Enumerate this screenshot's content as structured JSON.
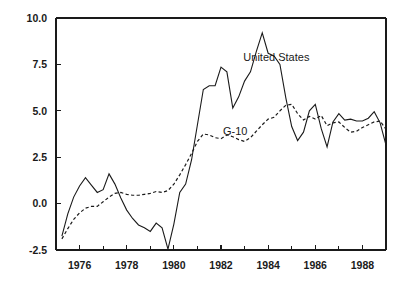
{
  "chart_data": {
    "type": "line",
    "title": "",
    "subtitle": "",
    "xlabel": "",
    "ylabel": "",
    "xlim": [
      1975.0,
      1989.0
    ],
    "ylim": [
      -2.5,
      10.0
    ],
    "grid": false,
    "legend_position": "inline-annotation",
    "y_ticks": [
      "10.0",
      "7.5",
      "5.0",
      "2.5",
      "0.0",
      "-2.5"
    ],
    "y_tick_values": [
      10.0,
      7.5,
      5.0,
      2.5,
      0.0,
      -2.5
    ],
    "x_ticks": [
      "1976",
      "1978",
      "1980",
      "1982",
      "1984",
      "1986",
      "1988"
    ],
    "x_tick_values": [
      1976,
      1978,
      1980,
      1982,
      1984,
      1986,
      1988
    ],
    "x_minor_tick_values": [
      1975,
      1977,
      1979,
      1981,
      1983,
      1985,
      1987,
      1989
    ],
    "annotations": [
      {
        "text": "United States",
        "x": 1984.35,
        "y": 7.9
      },
      {
        "text": "G-10",
        "x": 1982.6,
        "y": 3.9
      }
    ],
    "series": [
      {
        "name": "United States",
        "style": "solid",
        "color": "#1a1a1a",
        "x": [
          1975.25,
          1975.5,
          1975.75,
          1976.0,
          1976.25,
          1976.5,
          1976.75,
          1977.0,
          1977.25,
          1977.5,
          1977.75,
          1978.0,
          1978.25,
          1978.5,
          1978.75,
          1979.0,
          1979.25,
          1979.5,
          1979.75,
          1980.0,
          1980.25,
          1980.5,
          1980.75,
          1981.0,
          1981.25,
          1981.5,
          1981.75,
          1982.0,
          1982.25,
          1982.5,
          1982.75,
          1983.0,
          1983.25,
          1983.5,
          1983.75,
          1984.0,
          1984.25,
          1984.5,
          1984.75,
          1985.0,
          1985.25,
          1985.5,
          1985.75,
          1986.0,
          1986.25,
          1986.5,
          1986.75,
          1987.0,
          1987.25,
          1987.5,
          1987.75,
          1988.0,
          1988.25,
          1988.5,
          1988.75,
          1989.0
        ],
        "y": [
          -1.75,
          -0.55,
          0.35,
          0.95,
          1.4,
          1.0,
          0.6,
          0.75,
          1.6,
          1.05,
          0.3,
          -0.35,
          -0.8,
          -1.15,
          -1.3,
          -1.5,
          -1.05,
          -1.3,
          -2.45,
          -1.1,
          0.6,
          1.05,
          2.35,
          4.25,
          6.15,
          6.35,
          6.35,
          7.35,
          7.1,
          5.15,
          5.75,
          6.6,
          7.1,
          8.2,
          9.2,
          8.1,
          7.95,
          7.5,
          5.7,
          4.15,
          3.4,
          3.85,
          5.0,
          5.35,
          4.05,
          3.05,
          4.4,
          4.85,
          4.5,
          4.55,
          4.45,
          4.45,
          4.6,
          4.95,
          4.35,
          3.15
        ],
        "units": "percent"
      },
      {
        "name": "G-10",
        "style": "dashed",
        "color": "#1a1a1a",
        "x": [
          1975.25,
          1975.5,
          1975.75,
          1976.0,
          1976.25,
          1976.5,
          1976.75,
          1977.0,
          1977.25,
          1977.5,
          1977.75,
          1978.0,
          1978.25,
          1978.5,
          1978.75,
          1979.0,
          1979.25,
          1979.5,
          1979.75,
          1980.0,
          1980.25,
          1980.5,
          1980.75,
          1981.0,
          1981.25,
          1981.5,
          1981.75,
          1982.0,
          1982.25,
          1982.5,
          1982.75,
          1983.0,
          1983.25,
          1983.5,
          1983.75,
          1984.0,
          1984.25,
          1984.5,
          1984.75,
          1985.0,
          1985.25,
          1985.5,
          1985.75,
          1986.0,
          1986.25,
          1986.5,
          1986.75,
          1987.0,
          1987.25,
          1987.5,
          1987.75,
          1988.0,
          1988.25,
          1988.5,
          1988.75,
          1989.0
        ],
        "y": [
          -1.9,
          -1.35,
          -0.85,
          -0.5,
          -0.25,
          -0.15,
          -0.15,
          0.1,
          0.35,
          0.55,
          0.6,
          0.5,
          0.45,
          0.45,
          0.5,
          0.55,
          0.65,
          0.6,
          0.7,
          1.05,
          1.55,
          2.1,
          2.7,
          3.35,
          3.75,
          3.7,
          3.55,
          3.5,
          3.7,
          3.6,
          3.45,
          3.35,
          3.55,
          3.9,
          4.25,
          4.55,
          4.65,
          5.0,
          5.3,
          5.35,
          4.85,
          4.5,
          4.7,
          4.55,
          4.75,
          4.2,
          4.35,
          4.4,
          4.1,
          3.85,
          3.9,
          4.1,
          4.25,
          4.4,
          4.45,
          4.0
        ],
        "units": "percent"
      }
    ]
  },
  "top_fragment": {
    "text": ""
  }
}
